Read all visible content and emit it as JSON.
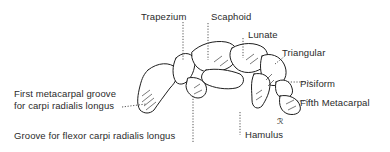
{
  "diagram": {
    "labels": {
      "trapezium": "Trapezium",
      "scaphoid": "Scaphoid",
      "lunate": "Lunate",
      "triangular": "Triangular",
      "pisiform": "Pisiform",
      "fifth_metacarpal": "Fifth Metacarpal",
      "first_metacarpal_line1": "First metacarpal groove",
      "first_metacarpal_line2": "for carpi radialis longus",
      "groove_flexor": "Groove for flexor carpi radialis longus",
      "hamulus": "Hamulus"
    },
    "signature": "ℛ",
    "colors": {
      "ink": "#1e1e1e",
      "text": "#2a2a2a",
      "background": "#ffffff"
    }
  }
}
